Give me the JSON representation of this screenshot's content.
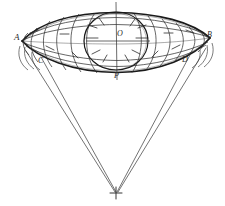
{
  "figure": {
    "background_color": "#ffffff",
    "ink_color": "#1f1f1f",
    "light_ink_color": "#555555",
    "width": 225,
    "height": 206
  },
  "labels": {
    "a": "A",
    "b": "B",
    "c": "C",
    "d": "D",
    "o": "O",
    "p": "P"
  },
  "points": [
    {
      "name": "A",
      "label": "A",
      "x": 22,
      "y": 41,
      "role": "left-vertex"
    },
    {
      "name": "B",
      "label": "B",
      "x": 210,
      "y": 38,
      "role": "right-vertex"
    },
    {
      "name": "C",
      "label": "C",
      "x": 44,
      "y": 62,
      "role": "left-lower-point"
    },
    {
      "name": "D",
      "label": "D",
      "x": 188,
      "y": 60,
      "role": "right-lower-point"
    },
    {
      "name": "O",
      "label": "O",
      "x": 116,
      "y": 40,
      "role": "center"
    },
    {
      "name": "P",
      "label": "P",
      "x": 117,
      "y": 72,
      "role": "bottom-vertex"
    },
    {
      "name": "apex",
      "label": "",
      "x": 116,
      "y": 192,
      "role": "apex-cross"
    }
  ],
  "lens": {
    "left_vertex": {
      "x": 22,
      "y": 41
    },
    "right_vertex": {
      "x": 210,
      "y": 38
    },
    "top_apex": {
      "x": 116,
      "y": 13
    },
    "bottom_apex": {
      "x": 117,
      "y": 72
    },
    "description": "vesica / lens outline formed by an upper arc and a lower arc meeting at A and B"
  },
  "inner_circle": {
    "center": {
      "x": 116,
      "y": 41
    },
    "radius_x": 32,
    "radius_y": 29,
    "description": "large circle centred on O inscribed within the lens"
  },
  "axes": {
    "vertical": {
      "x": 116,
      "y_top": 2,
      "y_bottom": 80
    },
    "horizontal": {
      "y": 41,
      "x_left": 86,
      "x_right": 150
    }
  },
  "converging_lines": [
    {
      "from": {
        "x": 41,
        "y": 57
      },
      "to": {
        "x": 116,
        "y": 192
      },
      "side": "left-inner"
    },
    {
      "from": {
        "x": 26,
        "y": 51
      },
      "to": {
        "x": 116,
        "y": 192
      },
      "side": "left-outer"
    },
    {
      "from": {
        "x": 190,
        "y": 55
      },
      "to": {
        "x": 116,
        "y": 192
      },
      "side": "right-inner"
    },
    {
      "from": {
        "x": 206,
        "y": 48
      },
      "to": {
        "x": 116,
        "y": 192
      },
      "side": "right-outer"
    }
  ],
  "mesh": {
    "meridian_count": 12,
    "parallel_count": 4,
    "description": "grid of meridian curves crossed by parallel curves filling the lens"
  }
}
